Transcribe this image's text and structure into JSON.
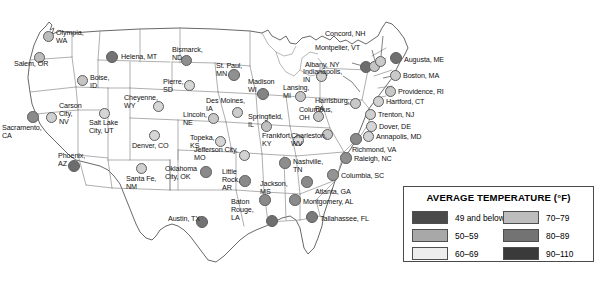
{
  "legend": {
    "title": "AVERAGE TEMPERATURE (°F)",
    "left_column": [
      {
        "label": "49 and below",
        "color": "#4a4a4a"
      },
      {
        "label": "50–59",
        "color": "#a8a8a8"
      },
      {
        "label": "60–69",
        "color": "#ededed"
      }
    ],
    "right_column": [
      {
        "label": "70–79",
        "color": "#bdbdbd"
      },
      {
        "label": "80–89",
        "color": "#737373"
      },
      {
        "label": "90–110",
        "color": "#3a3a3a"
      }
    ]
  },
  "colors": {
    "band_49_and_below": "#4a4a4a",
    "band_50_59": "#a8a8a8",
    "band_60_69": "#ededed",
    "band_70_79": "#bdbdbd",
    "band_80_89": "#737373",
    "band_90_110": "#3a3a3a",
    "map_outline": "#4d4d4d",
    "state_border": "#8d8d8d",
    "label_text": "#111111"
  },
  "cities": [
    {
      "name": "Olympia,\nWA",
      "dot_x": 48,
      "dot_y": 36,
      "dot_r": 5.5,
      "color": "#bdbdbd",
      "label_x": 56,
      "label_y": 29,
      "align": "left"
    },
    {
      "name": "Salem, OR",
      "dot_x": 39,
      "dot_y": 57,
      "dot_r": 5.5,
      "color": "#bdbdbd",
      "label_x": 14,
      "label_y": 60,
      "align": "left"
    },
    {
      "name": "Boise,\nID",
      "dot_x": 82,
      "dot_y": 80,
      "dot_r": 5.5,
      "color": "#c4c4c4",
      "label_x": 90,
      "label_y": 74,
      "align": "left"
    },
    {
      "name": "Helena, MT",
      "dot_x": 112,
      "dot_y": 57,
      "dot_r": 6.0,
      "color": "#737373",
      "label_x": 121,
      "label_y": 53,
      "align": "left"
    },
    {
      "name": "Bismarck,\nND",
      "dot_x": 186,
      "dot_y": 60,
      "dot_r": 5.5,
      "color": "#8e8e8e",
      "label_x": 172,
      "label_y": 46,
      "align": "left"
    },
    {
      "name": "Pierre,\nSD",
      "dot_x": 189,
      "dot_y": 85,
      "dot_r": 5.5,
      "color": "#d6d6d6",
      "label_x": 163,
      "label_y": 78,
      "align": "left"
    },
    {
      "name": "Cheyenne,\nWY",
      "dot_x": 158,
      "dot_y": 106,
      "dot_r": 5.5,
      "color": "#d6d6d6",
      "label_x": 124,
      "label_y": 94,
      "align": "left"
    },
    {
      "name": "Carson\nCity,\nNV",
      "dot_x": 51,
      "dot_y": 117,
      "dot_r": 5.5,
      "color": "#d0d0d0",
      "label_x": 59,
      "label_y": 102,
      "align": "left"
    },
    {
      "name": "Sacramento,\nCA",
      "dot_x": 33,
      "dot_y": 117,
      "dot_r": 5.8,
      "color": "#8a8a8a",
      "label_x": 2,
      "label_y": 124,
      "align": "left"
    },
    {
      "name": "Salt Lake\nCity, UT",
      "dot_x": 104,
      "dot_y": 113,
      "dot_r": 5.5,
      "color": "#d6d6d6",
      "label_x": 89,
      "label_y": 119,
      "align": "left"
    },
    {
      "name": "Denver, CO",
      "dot_x": 154,
      "dot_y": 135,
      "dot_r": 5.5,
      "color": "#d6d6d6",
      "label_x": 132,
      "label_y": 142,
      "align": "left"
    },
    {
      "name": "Phoenix,\nAZ",
      "dot_x": 74,
      "dot_y": 166,
      "dot_r": 6.0,
      "color": "#6d6d6d",
      "label_x": 58,
      "label_y": 152,
      "align": "left"
    },
    {
      "name": "Santa Fe,\nNM",
      "dot_x": 141,
      "dot_y": 168,
      "dot_r": 5.5,
      "color": "#cfcfcf",
      "label_x": 126,
      "label_y": 175,
      "align": "left"
    },
    {
      "name": "Lincoln,\nNE",
      "dot_x": 213,
      "dot_y": 118,
      "dot_r": 5.5,
      "color": "#c9c9c9",
      "label_x": 183,
      "label_y": 111,
      "align": "left"
    },
    {
      "name": "Topeka,\nKS",
      "dot_x": 220,
      "dot_y": 141,
      "dot_r": 5.5,
      "color": "#d4d4d4",
      "label_x": 190,
      "label_y": 134,
      "align": "left"
    },
    {
      "name": "Oklahoma\nCity, OK",
      "dot_x": 206,
      "dot_y": 172,
      "dot_r": 5.8,
      "color": "#8a8a8a",
      "label_x": 165,
      "label_y": 165,
      "align": "left"
    },
    {
      "name": "Austin, TX",
      "dot_x": 202,
      "dot_y": 222,
      "dot_r": 6.0,
      "color": "#737373",
      "label_x": 168,
      "label_y": 215,
      "align": "left"
    },
    {
      "name": "St. Paul,\nMN",
      "dot_x": 234,
      "dot_y": 75,
      "dot_r": 6.0,
      "color": "#909090",
      "label_x": 216,
      "label_y": 62,
      "align": "left"
    },
    {
      "name": "Des Moines,\nIA",
      "dot_x": 237,
      "dot_y": 112,
      "dot_r": 5.5,
      "color": "#cccccc",
      "label_x": 206,
      "label_y": 97,
      "align": "left"
    },
    {
      "name": "Madison\nWI",
      "dot_x": 263,
      "dot_y": 94,
      "dot_r": 6.0,
      "color": "#848484",
      "label_x": 248,
      "label_y": 78,
      "align": "left"
    },
    {
      "name": "Springfield,\nIL",
      "dot_x": 266,
      "dot_y": 126,
      "dot_r": 5.5,
      "color": "#c0c0c0",
      "label_x": 248,
      "label_y": 113,
      "align": "left"
    },
    {
      "name": "Jefferson City,\nMO",
      "dot_x": 244,
      "dot_y": 155,
      "dot_r": 5.5,
      "color": "#d2d2d2",
      "label_x": 194,
      "label_y": 146,
      "align": "left"
    },
    {
      "name": "Lansing,\nMI",
      "dot_x": 300,
      "dot_y": 96,
      "dot_r": 5.5,
      "color": "#c6c6c6",
      "label_x": 283,
      "label_y": 84,
      "align": "left"
    },
    {
      "name": "Frankfort,\nKY",
      "dot_x": 298,
      "dot_y": 140,
      "dot_r": 5.5,
      "color": "#e2e2e2",
      "label_x": 262,
      "label_y": 132,
      "align": "left"
    },
    {
      "name": "Indianapolis,\nIN",
      "dot_x": 321,
      "dot_y": 76,
      "dot_r": 5.5,
      "color": "#d0d0d0",
      "label_x": 303,
      "label_y": 68,
      "align": "left"
    },
    {
      "name": "Columbus,\nOH",
      "dot_x": 318,
      "dot_y": 116,
      "dot_r": 5.5,
      "color": "#c8c8c8",
      "label_x": 299,
      "label_y": 106,
      "align": "left"
    },
    {
      "name": "Charleston,\nWV",
      "dot_x": 327,
      "dot_y": 134,
      "dot_r": 5.5,
      "color": "#c6c6c6",
      "label_x": 291,
      "label_y": 132,
      "align": "left"
    },
    {
      "name": "Nashville,\nTN",
      "dot_x": 285,
      "dot_y": 163,
      "dot_r": 5.8,
      "color": "#8e8e8e",
      "label_x": 293,
      "label_y": 158,
      "align": "left"
    },
    {
      "name": "Little\nRock,\nAR",
      "dot_x": 245,
      "dot_y": 181,
      "dot_r": 5.8,
      "color": "#8a8a8a",
      "label_x": 222,
      "label_y": 168,
      "align": "left"
    },
    {
      "name": "Jackson,\nMS",
      "dot_x": 265,
      "dot_y": 200,
      "dot_r": 5.8,
      "color": "#8a8a8a",
      "label_x": 260,
      "label_y": 180,
      "align": "left"
    },
    {
      "name": "Baton\nRouge,\nLA",
      "dot_x": 272,
      "dot_y": 221,
      "dot_r": 6.2,
      "color": "#6e6e6e",
      "label_x": 231,
      "label_y": 198,
      "align": "left"
    },
    {
      "name": "Montgomery, AL",
      "dot_x": 295,
      "dot_y": 200,
      "dot_r": 5.8,
      "color": "#8a8a8a",
      "label_x": 303,
      "label_y": 198,
      "align": "left"
    },
    {
      "name": "Atlanta, GA",
      "dot_x": 307,
      "dot_y": 182,
      "dot_r": 5.8,
      "color": "#8a8a8a",
      "label_x": 315,
      "label_y": 188,
      "align": "left"
    },
    {
      "name": "Tallahassee, FL",
      "dot_x": 312,
      "dot_y": 217,
      "dot_r": 6.0,
      "color": "#7a7a7a",
      "label_x": 320,
      "label_y": 215,
      "align": "left"
    },
    {
      "name": "Columbia, SC",
      "dot_x": 333,
      "dot_y": 175,
      "dot_r": 5.8,
      "color": "#949494",
      "label_x": 341,
      "label_y": 172,
      "align": "left"
    },
    {
      "name": "Raleigh, NC",
      "dot_x": 346,
      "dot_y": 158,
      "dot_r": 5.8,
      "color": "#8e8e8e",
      "label_x": 354,
      "label_y": 155,
      "align": "left"
    },
    {
      "name": "Richmond, VA",
      "dot_x": 356,
      "dot_y": 139,
      "dot_r": 5.8,
      "color": "#8a8a8a",
      "label_x": 352,
      "label_y": 146,
      "align": "left"
    },
    {
      "name": "Harrisburg,\nPA",
      "dot_x": 355,
      "dot_y": 103,
      "dot_r": 5.5,
      "color": "#c8c8c8",
      "label_x": 315,
      "label_y": 97,
      "align": "left"
    },
    {
      "name": "Albany, NY",
      "dot_x": 366,
      "dot_y": 67,
      "dot_r": 6.0,
      "color": "#6d6d6d",
      "label_x": 305,
      "label_y": 61,
      "align": "left"
    },
    {
      "name": "Montpelier, VT",
      "dot_x": 374,
      "dot_y": 66,
      "dot_r": 5.5,
      "color": "#c4c4c4",
      "label_x": 315,
      "label_y": 44,
      "align": "left"
    },
    {
      "name": "Concord, NH",
      "dot_x": 380,
      "dot_y": 61,
      "dot_r": 5.5,
      "color": "#cacaca",
      "label_x": 325,
      "label_y": 30,
      "align": "left"
    },
    {
      "name": "Augusta, ME",
      "dot_x": 396,
      "dot_y": 58,
      "dot_r": 6.2,
      "color": "#707070",
      "label_x": 404,
      "label_y": 56,
      "align": "left"
    },
    {
      "name": "Boston, MA",
      "dot_x": 395,
      "dot_y": 75,
      "dot_r": 5.5,
      "color": "#cacaca",
      "label_x": 403,
      "label_y": 72,
      "align": "left"
    },
    {
      "name": "Providence, RI",
      "dot_x": 390,
      "dot_y": 91,
      "dot_r": 5.5,
      "color": "#c8c8c8",
      "label_x": 398,
      "label_y": 88,
      "align": "left"
    },
    {
      "name": "Hartford, CT",
      "dot_x": 378,
      "dot_y": 101,
      "dot_r": 5.5,
      "color": "#d2d2d2",
      "label_x": 386,
      "label_y": 98,
      "align": "left"
    },
    {
      "name": "Trenton, NJ",
      "dot_x": 370,
      "dot_y": 114,
      "dot_r": 5.5,
      "color": "#cfcfcf",
      "label_x": 378,
      "label_y": 111,
      "align": "left"
    },
    {
      "name": "Dover, DE",
      "dot_x": 371,
      "dot_y": 126,
      "dot_r": 5.5,
      "color": "#d6d6d6",
      "label_x": 379,
      "label_y": 123,
      "align": "left"
    },
    {
      "name": "Annapolis, MD",
      "dot_x": 368,
      "dot_y": 136,
      "dot_r": 5.5,
      "color": "#d2d2d2",
      "label_x": 376,
      "label_y": 133,
      "align": "left"
    }
  ]
}
